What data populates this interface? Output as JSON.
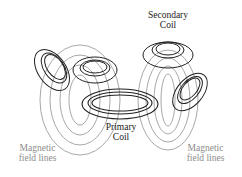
{
  "diagram": {
    "labels": {
      "secondary_coil": "Secondary\nCoil",
      "primary_coil": "Primary\nCoil",
      "field_lines_left": "Magnetic\nfield lines",
      "field_lines_right": "Magnetic\nfield lines"
    },
    "colors": {
      "coil": "#222222",
      "field_lines": "#a0a0a0",
      "field_label": "#8c8c8c"
    }
  }
}
